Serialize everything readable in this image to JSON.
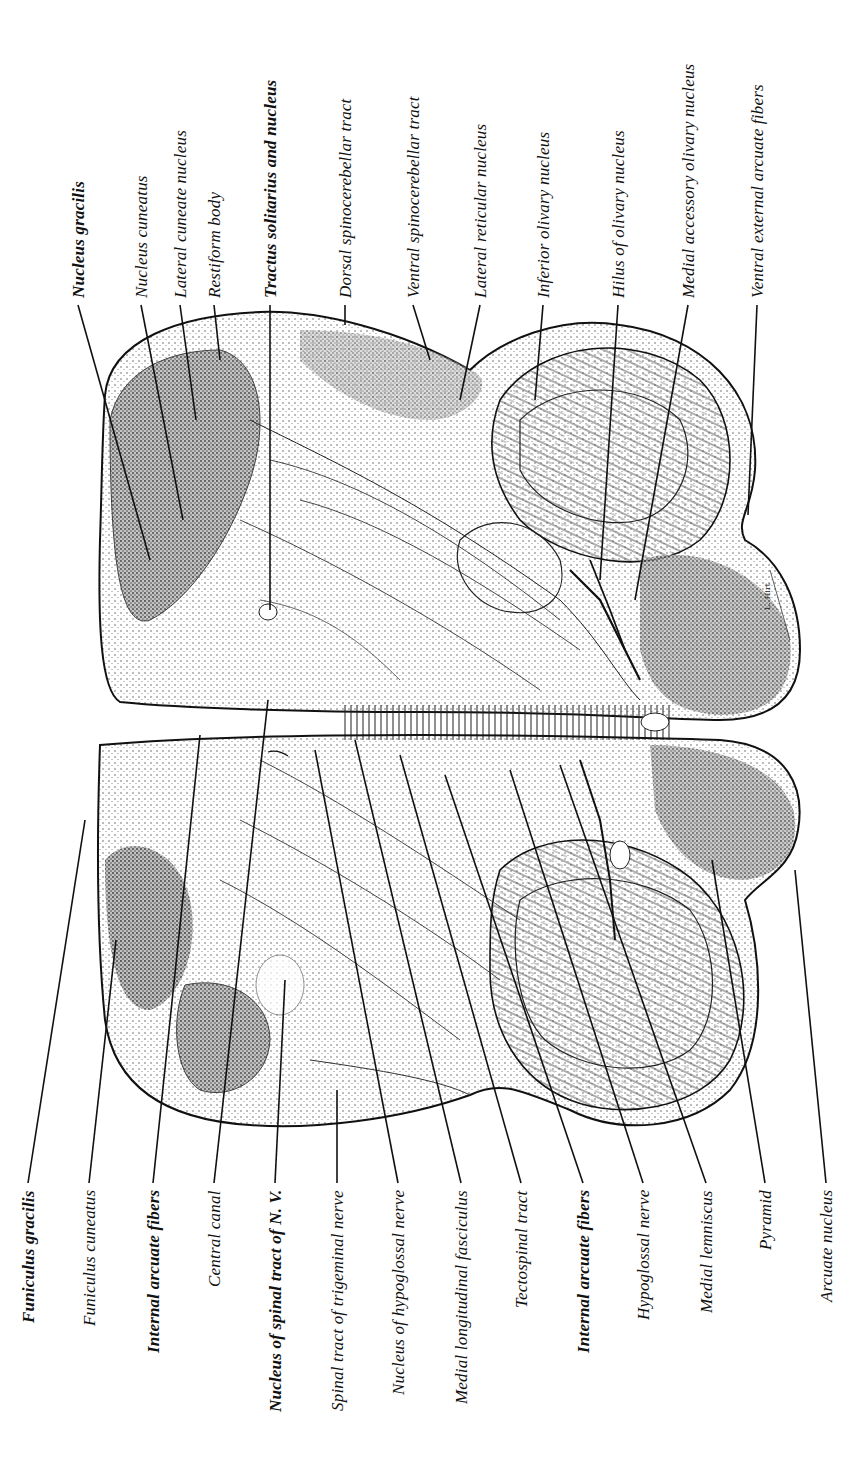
{
  "figure": {
    "orientation": "rotated 90 degrees counter-clockwise",
    "artist_signature": "L. Hirt"
  },
  "labels_top": [
    {
      "text": "Nucleus gracilis",
      "bold": true,
      "x": 78,
      "line": [
        78,
        305,
        150,
        560
      ]
    },
    {
      "text": "Nucleus cuneatus",
      "bold": false,
      "x": 141,
      "line": [
        141,
        305,
        183,
        520
      ]
    },
    {
      "text": "Lateral cuneate nucleus",
      "bold": false,
      "x": 180,
      "line": [
        180,
        305,
        196,
        420
      ]
    },
    {
      "text": "Restiform body",
      "bold": false,
      "x": 214,
      "line": [
        214,
        305,
        220,
        360
      ]
    },
    {
      "text": "Tractus solitarius and nucleus",
      "bold": true,
      "x": 270,
      "line": [
        270,
        305,
        270,
        610
      ]
    },
    {
      "text": "Dorsal spinocerebellar tract",
      "bold": false,
      "x": 345,
      "line": [
        345,
        305,
        345,
        325
      ]
    },
    {
      "text": "Ventral spinocerebellar tract",
      "bold": false,
      "x": 413,
      "line": [
        413,
        305,
        430,
        360
      ]
    },
    {
      "text": "Lateral reticular nucleus",
      "bold": false,
      "x": 480,
      "line": [
        480,
        305,
        460,
        400
      ]
    },
    {
      "text": "Inferior olivary nucleus",
      "bold": false,
      "x": 543,
      "line": [
        543,
        305,
        535,
        400
      ]
    },
    {
      "text": "Hilus of olivary nucleus",
      "bold": false,
      "x": 618,
      "line": [
        618,
        305,
        600,
        580
      ]
    },
    {
      "text": "Medial accessory olivary nucleus",
      "bold": false,
      "x": 688,
      "line": [
        688,
        305,
        635,
        600
      ]
    },
    {
      "text": "Ventral external arcuate fibers",
      "bold": false,
      "x": 757,
      "line": [
        757,
        305,
        748,
        515
      ]
    }
  ],
  "labels_bottom": [
    {
      "text": "Funiculus gracilis",
      "bold": true,
      "x": 28,
      "line": [
        28,
        1183,
        85,
        820
      ]
    },
    {
      "text": "Funiculus cuneatus",
      "bold": false,
      "x": 89,
      "line": [
        89,
        1183,
        116,
        940
      ]
    },
    {
      "text": "Internal arcuate fibers",
      "bold": true,
      "x": 153,
      "line": [
        153,
        1183,
        200,
        735
      ]
    },
    {
      "text": "Central canal",
      "bold": false,
      "x": 214,
      "line": [
        214,
        1183,
        268,
        700
      ]
    },
    {
      "text": "Nucleus of spinal tract of N. V.",
      "bold": true,
      "x": 275,
      "line": [
        275,
        1183,
        285,
        980
      ]
    },
    {
      "text": "Spinal tract of trigeminal nerve",
      "bold": false,
      "x": 337,
      "line": [
        337,
        1183,
        337,
        1090
      ]
    },
    {
      "text": "Nucleus of hypoglossal nerve",
      "bold": false,
      "x": 398,
      "line": [
        398,
        1183,
        315,
        750
      ]
    },
    {
      "text": "Medial longitudinal fasciculus",
      "bold": false,
      "x": 461,
      "line": [
        461,
        1183,
        355,
        740
      ]
    },
    {
      "text": "Tectospinal tract",
      "bold": false,
      "x": 521,
      "line": [
        521,
        1183,
        400,
        755
      ]
    },
    {
      "text": "Internal arcuate fibers",
      "bold": true,
      "x": 583,
      "line": [
        583,
        1183,
        445,
        775
      ]
    },
    {
      "text": "Hypoglossal nerve",
      "bold": false,
      "x": 643,
      "line": [
        643,
        1183,
        510,
        770
      ]
    },
    {
      "text": "Medial lemniscus",
      "bold": false,
      "x": 706,
      "line": [
        706,
        1183,
        560,
        765
      ]
    },
    {
      "text": "Pyramid",
      "bold": false,
      "x": 765,
      "line": [
        765,
        1183,
        712,
        860
      ]
    },
    {
      "text": "Arcuate nucleus",
      "bold": false,
      "x": 826,
      "line": [
        826,
        1183,
        795,
        870
      ]
    }
  ],
  "colors": {
    "ink": "#111111",
    "background": "#ffffff",
    "stipple": "#555555"
  }
}
